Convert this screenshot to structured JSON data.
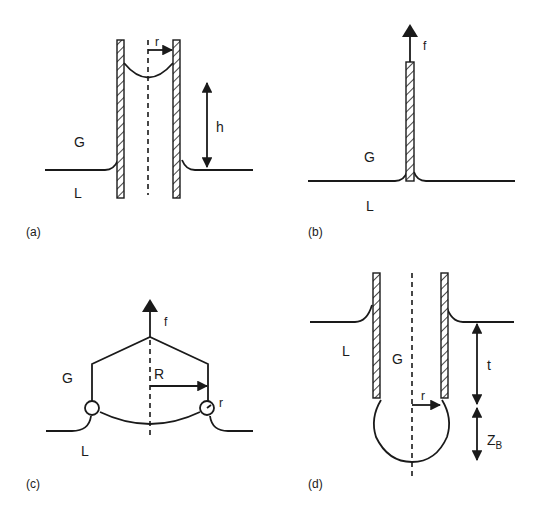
{
  "figure": {
    "panels": [
      {
        "id": "a",
        "caption": "(a)",
        "description": "Capillary rise between tube walls",
        "labels": {
          "gas": "G",
          "liquid": "L",
          "radius": "r",
          "height": "h"
        }
      },
      {
        "id": "b",
        "caption": "(b)",
        "description": "Wilhelmy plate pulled from liquid",
        "labels": {
          "gas": "G",
          "liquid": "L",
          "force": "f"
        }
      },
      {
        "id": "c",
        "caption": "(c)",
        "description": "Du Noüy ring pulled from liquid",
        "labels": {
          "gas": "G",
          "liquid": "L",
          "force": "f",
          "ring_radius": "R",
          "wire_radius": "r"
        }
      },
      {
        "id": "d",
        "caption": "(d)",
        "description": "Maximum bubble pressure: tube immersed in liquid",
        "labels": {
          "gas": "G",
          "liquid": "L",
          "radius": "r",
          "depth": "t",
          "bubble_height_main": "Z",
          "bubble_height_sub": "B"
        }
      }
    ],
    "colors": {
      "ink": "#1a1a1a",
      "background": "#ffffff"
    }
  }
}
